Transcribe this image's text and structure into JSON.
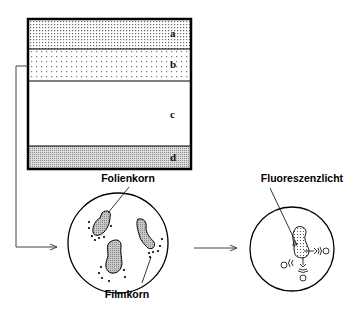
{
  "diagram": {
    "layers": [
      {
        "id": "a",
        "label": "a",
        "pattern": "dense-dots"
      },
      {
        "id": "b",
        "label": "b",
        "pattern": "sparse-dots"
      },
      {
        "id": "c",
        "label": "c",
        "pattern": "none"
      },
      {
        "id": "d",
        "label": "d",
        "pattern": "fine-dots"
      }
    ],
    "labels": {
      "screen_grain": "Folienkorn",
      "film_grain": "Filmkorn",
      "fluorescence": "Fluoreszenzlicht"
    },
    "colors": {
      "stroke": "#000000",
      "grain_fill": "#b8b8b8",
      "background": "#ffffff"
    }
  }
}
